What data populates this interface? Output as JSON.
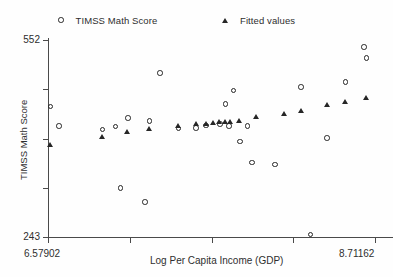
{
  "chart_data": {
    "type": "scatter",
    "title": "",
    "xlabel": "Log Per Capita Income (GDP)",
    "ylabel": "TIMSS Math Score",
    "xlim": [
      6.57902,
      8.71162
    ],
    "ylim": [
      243,
      552
    ],
    "xticks": [
      6.57902,
      8.71162
    ],
    "xtick_labels": [
      "6.57902",
      "8.71162"
    ],
    "yticks": [
      243,
      552
    ],
    "ytick_labels": [
      "243",
      "552"
    ],
    "grid": false,
    "legend_position": "top",
    "marker_color": "#262626",
    "series": [
      {
        "name": "TIMSS Math Score",
        "marker": "circle",
        "points": [
          {
            "x": 6.594,
            "y": 448
          },
          {
            "x": 6.65,
            "y": 417
          },
          {
            "x": 6.936,
            "y": 412
          },
          {
            "x": 7.02,
            "y": 416
          },
          {
            "x": 7.052,
            "y": 320
          },
          {
            "x": 7.1,
            "y": 430
          },
          {
            "x": 7.21,
            "y": 298
          },
          {
            "x": 7.24,
            "y": 425
          },
          {
            "x": 7.31,
            "y": 500
          },
          {
            "x": 7.43,
            "y": 413
          },
          {
            "x": 7.545,
            "y": 414
          },
          {
            "x": 7.61,
            "y": 418
          },
          {
            "x": 7.7,
            "y": 420
          },
          {
            "x": 7.735,
            "y": 452
          },
          {
            "x": 7.76,
            "y": 417
          },
          {
            "x": 7.79,
            "y": 473
          },
          {
            "x": 7.83,
            "y": 393
          },
          {
            "x": 7.88,
            "y": 417
          },
          {
            "x": 7.91,
            "y": 360
          },
          {
            "x": 8.06,
            "y": 357
          },
          {
            "x": 8.23,
            "y": 478
          },
          {
            "x": 8.29,
            "y": 247
          },
          {
            "x": 8.4,
            "y": 398
          },
          {
            "x": 8.52,
            "y": 486
          },
          {
            "x": 8.64,
            "y": 541
          },
          {
            "x": 8.655,
            "y": 524
          }
        ]
      },
      {
        "name": "Fitted values",
        "marker": "triangle",
        "points": [
          {
            "x": 6.594,
            "y": 388
          },
          {
            "x": 6.936,
            "y": 400
          },
          {
            "x": 7.1,
            "y": 408
          },
          {
            "x": 7.24,
            "y": 413
          },
          {
            "x": 7.43,
            "y": 417
          },
          {
            "x": 7.545,
            "y": 420
          },
          {
            "x": 7.61,
            "y": 421
          },
          {
            "x": 7.66,
            "y": 422
          },
          {
            "x": 7.7,
            "y": 423
          },
          {
            "x": 7.735,
            "y": 424
          },
          {
            "x": 7.77,
            "y": 424
          },
          {
            "x": 7.83,
            "y": 426
          },
          {
            "x": 7.94,
            "y": 431
          },
          {
            "x": 8.12,
            "y": 437
          },
          {
            "x": 8.23,
            "y": 441
          },
          {
            "x": 8.4,
            "y": 450
          },
          {
            "x": 8.52,
            "y": 455
          },
          {
            "x": 8.655,
            "y": 462
          }
        ]
      }
    ]
  },
  "legend": {
    "entries": [
      {
        "label": "TIMSS Math Score",
        "marker": "circle-marker-icon"
      },
      {
        "label": "Fitted values",
        "marker": "triangle-marker-icon"
      }
    ]
  },
  "axes": {
    "y_title": "TIMSS Math Score",
    "x_title": "Log Per Capita Income (GDP)",
    "y_top_label": "552",
    "y_bottom_label": "243",
    "x_left_label": "6.57902",
    "x_right_label": "8.71162"
  }
}
